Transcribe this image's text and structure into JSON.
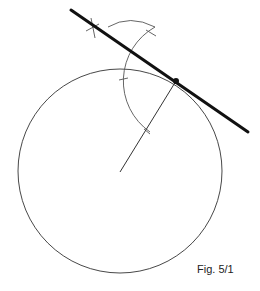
{
  "figure": {
    "caption": "Fig. 5/1",
    "colors": {
      "background": "#ffffff",
      "thin_line": "#333333",
      "construction_arc": "#555555",
      "tangent_line": "#111111"
    },
    "circle": {
      "cx": 120,
      "cy": 171,
      "r": 102
    },
    "center_point": {
      "x": 120,
      "y": 172
    },
    "tangent_point": {
      "x": 176,
      "y": 81
    },
    "radius_line": {
      "x1": 120,
      "y1": 172,
      "x2": 176,
      "y2": 81
    },
    "tangent_line": {
      "x1": 71,
      "y1": 10,
      "x2": 248,
      "y2": 132
    },
    "construction_arc": {
      "cx": 176,
      "cy": 81,
      "r": 60
    }
  }
}
